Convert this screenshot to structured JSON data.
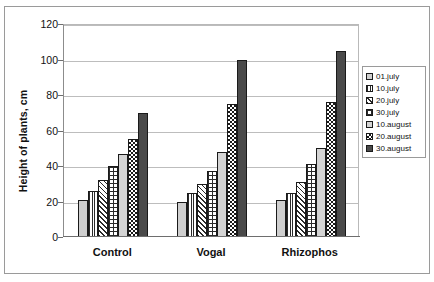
{
  "chart_data": {
    "type": "bar",
    "title": "",
    "xlabel": "",
    "ylabel": "Height of plants, cm",
    "categories": [
      "Control",
      "Vogal",
      "Rhizophos"
    ],
    "ylim": [
      0,
      120
    ],
    "yticks": [
      0,
      20,
      40,
      60,
      80,
      100,
      120
    ],
    "ytick_labels": [
      "0",
      "20",
      "40",
      "60",
      "80",
      "100",
      "120"
    ],
    "grid": true,
    "legend_position": "right",
    "series": [
      {
        "name": "01.july",
        "pattern": "light-gray-stipple",
        "values": [
          21,
          20,
          21
        ]
      },
      {
        "name": "10.july",
        "pattern": "vertical-stripes",
        "values": [
          26,
          25,
          25
        ]
      },
      {
        "name": "20.july",
        "pattern": "diagonal-hatch",
        "values": [
          32,
          30,
          31
        ]
      },
      {
        "name": "30.july",
        "pattern": "cross-hatch-grid",
        "values": [
          40,
          37,
          41
        ]
      },
      {
        "name": "10.august",
        "pattern": "solid-light-gray",
        "values": [
          47,
          48,
          50
        ]
      },
      {
        "name": "20.august",
        "pattern": "checkerboard",
        "values": [
          55,
          75,
          76
        ]
      },
      {
        "name": "30.august",
        "pattern": "solid-dark-gray",
        "values": [
          70,
          100,
          105
        ]
      }
    ]
  },
  "legend": {
    "items": [
      {
        "label": "01.july"
      },
      {
        "label": "10.july"
      },
      {
        "label": "20.july"
      },
      {
        "label": "30.july"
      },
      {
        "label": "10.august"
      },
      {
        "label": "20.august"
      },
      {
        "label": "30.august"
      }
    ]
  },
  "colors": {
    "frame": "#9a9a9a",
    "gridline": "#bdbdbd",
    "axis": "#6e6e6e",
    "bar_outline": "#1a1a1a",
    "text": "#111111",
    "background": "#ffffff"
  }
}
